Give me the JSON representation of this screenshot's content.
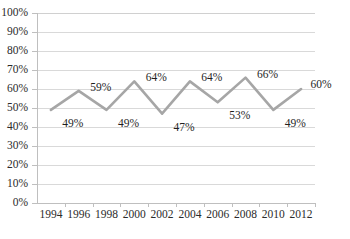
{
  "chart_data": {
    "type": "line",
    "title": "",
    "xlabel": "",
    "ylabel": "",
    "categories": [
      "1994",
      "1996",
      "1998",
      "2000",
      "2002",
      "2004",
      "2006",
      "2008",
      "2010",
      "2012"
    ],
    "values": [
      49,
      59,
      49,
      64,
      47,
      64,
      53,
      66,
      49,
      60
    ],
    "point_labels": [
      "49%",
      "59%",
      "49%",
      "64%",
      "47%",
      "64%",
      "53%",
      "66%",
      "49%",
      "60%"
    ],
    "ylim": [
      0,
      100
    ],
    "ytick_labels": [
      "100%",
      "90%",
      "80%",
      "70%",
      "60%",
      "50%",
      "40%",
      "30%",
      "20%",
      "10%",
      "0%"
    ],
    "ytick_values": [
      100,
      90,
      80,
      70,
      60,
      50,
      40,
      30,
      20,
      10,
      0
    ],
    "grid": "horizontal",
    "legend": "none",
    "series_color": "#a6a6a6",
    "grid_color": "#d9d9d9",
    "axis_color": "#bfbfbf",
    "label_color": "#1f1f1f"
  }
}
